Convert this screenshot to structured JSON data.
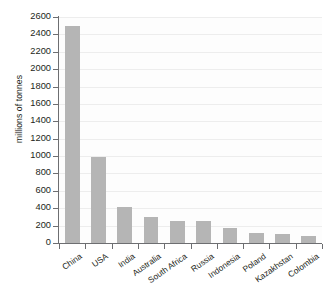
{
  "chart_data": {
    "type": "bar",
    "title": "",
    "subtitle": "",
    "xlabel": "",
    "ylabel": "millions of tonnes",
    "ylim": [
      0,
      2600
    ],
    "ytick_step": 200,
    "yticks": [
      0,
      200,
      400,
      600,
      800,
      1000,
      1200,
      1400,
      1600,
      1800,
      2000,
      2200,
      2400,
      2600
    ],
    "ytick_labels": [
      "0",
      "200",
      "400",
      "600",
      "800",
      "1000",
      "1200",
      "1400",
      "1600",
      "1800",
      "2000",
      "2200",
      "2400",
      "2600"
    ],
    "categories": [
      "China",
      "USA",
      "India",
      "Australia",
      "South Africa",
      "Russia",
      "Indonesia",
      "Poland",
      "Kazakhstan",
      "Colombia"
    ],
    "values": [
      2500,
      990,
      415,
      300,
      255,
      250,
      170,
      115,
      105,
      80
    ],
    "grid": true,
    "grid_axis": "y",
    "legend": false,
    "legend_position": "none",
    "bar_color": "#b5b5b5",
    "axis_color": "#6d6e71",
    "gridline_color": "#ededed",
    "plot_background": "#fdfdfd",
    "text_color": "#231f20"
  }
}
